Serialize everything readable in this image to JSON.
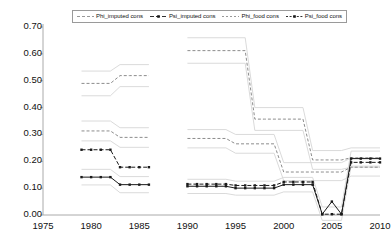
{
  "chart_data": {
    "type": "line",
    "title": "",
    "subtitle": "",
    "xlabel": "",
    "ylabel": "",
    "xlim": [
      1975,
      2010
    ],
    "ylim": [
      0.0,
      0.7
    ],
    "grid": false,
    "legend_position": "top-center",
    "xticks": [
      1975,
      1980,
      1985,
      1990,
      1995,
      2000,
      2005,
      2010
    ],
    "xtick_labels": [
      "1975",
      "1980",
      "1985",
      "1990",
      "1995",
      "2000",
      "2005",
      "2010"
    ],
    "yticks": [
      0.0,
      0.1,
      0.2,
      0.3,
      0.4,
      0.5,
      0.6,
      0.7
    ],
    "ytick_labels": [
      "0.00",
      "0.10",
      "0.20",
      "0.30",
      "0.40",
      "0.50",
      "0.60",
      "0.70"
    ],
    "series": [
      {
        "name": "Phi_imputed cons",
        "color": "#8c8c8c",
        "dash": "3,2",
        "marker": "none",
        "width": 1,
        "segments": [
          {
            "x": [
              1979,
              1980,
              1981,
              1982,
              1983,
              1984,
              1985,
              1986
            ],
            "y": [
              0.49,
              0.49,
              0.49,
              0.49,
              0.519,
              0.519,
              0.519,
              0.519
            ]
          },
          {
            "x": [
              1990,
              1991,
              1992,
              1993,
              1994,
              1995,
              1996,
              1997,
              1998,
              1999,
              2000,
              2001,
              2002,
              2003,
              2004,
              2005,
              2006,
              2007,
              2008,
              2009,
              2010
            ],
            "y": [
              0.612,
              0.612,
              0.612,
              0.612,
              0.612,
              0.612,
              0.612,
              0.357,
              0.357,
              0.357,
              0.357,
              0.357,
              0.357,
              0.205,
              0.205,
              0.205,
              0.205,
              0.213,
              0.213,
              0.213,
              0.213
            ]
          }
        ]
      },
      {
        "name": "Psi_imputed cons",
        "color": "#1a1a1a",
        "dash": "4,2",
        "marker": "square",
        "width": 1,
        "segments": [
          {
            "x": [
              1979,
              1980,
              1981,
              1982,
              1983,
              1984,
              1985,
              1986
            ],
            "y": [
              0.243,
              0.243,
              0.243,
              0.243,
              0.178,
              0.178,
              0.178,
              0.178
            ]
          },
          {
            "x": [
              1990,
              1991,
              1992,
              1993,
              1994,
              1995,
              1996,
              1997,
              1998,
              1999,
              2000,
              2001,
              2002,
              2003,
              2004,
              2005,
              2006,
              2007,
              2008,
              2009,
              2010
            ],
            "y": [
              0.115,
              0.115,
              0.115,
              0.115,
              0.115,
              0.11,
              0.11,
              0.11,
              0.11,
              0.11,
              0.123,
              0.123,
              0.123,
              0.123,
              0.003,
              0.003,
              0.003,
              0.196,
              0.196,
              0.196,
              0.196
            ]
          }
        ]
      },
      {
        "name": "Phi_food cons",
        "color": "#8c8c8c",
        "dash": "3,2",
        "marker": "none",
        "width": 1,
        "segments": [
          {
            "x": [
              1979,
              1980,
              1981,
              1982,
              1983,
              1984,
              1985,
              1986
            ],
            "y": [
              0.313,
              0.313,
              0.313,
              0.313,
              0.289,
              0.289,
              0.289,
              0.289
            ]
          },
          {
            "x": [
              1990,
              1991,
              1992,
              1993,
              1994,
              1995,
              1996,
              1997,
              1998,
              1999,
              2000,
              2001,
              2002,
              2003,
              2004,
              2005,
              2006,
              2007,
              2008,
              2009,
              2010
            ],
            "y": [
              0.285,
              0.285,
              0.285,
              0.285,
              0.285,
              0.265,
              0.265,
              0.265,
              0.265,
              0.265,
              0.16,
              0.16,
              0.16,
              0.16,
              0.16,
              0.16,
              0.16,
              0.178,
              0.178,
              0.178,
              0.178
            ]
          }
        ]
      },
      {
        "name": "Psi_food cons",
        "color": "#1a1a1a",
        "dash": "1,0",
        "marker": "square",
        "width": 1,
        "segments": [
          {
            "x": [
              1979,
              1980,
              1981,
              1982,
              1983,
              1984,
              1985,
              1986
            ],
            "y": [
              0.141,
              0.141,
              0.141,
              0.141,
              0.113,
              0.113,
              0.113,
              0.113
            ]
          },
          {
            "x": [
              1990,
              1991,
              1992,
              1993,
              1994,
              1995,
              1996,
              1997,
              1998,
              1999,
              2000,
              2001,
              2002,
              2003,
              2004,
              2005,
              2006,
              2007,
              2008,
              2009,
              2010
            ],
            "y": [
              0.107,
              0.107,
              0.107,
              0.107,
              0.107,
              0.1,
              0.1,
              0.1,
              0.1,
              0.1,
              0.113,
              0.113,
              0.113,
              0.113,
              0.003,
              0.05,
              0.003,
              0.21,
              0.21,
              0.21,
              0.21
            ]
          }
        ]
      }
    ],
    "ghost_series": [
      {
        "name": "Phi_imputed cons band",
        "color": "#d6d6d6",
        "segments": [
          {
            "x": [
              1979,
              1982,
              1983,
              1986
            ],
            "y": [
              0.536,
              0.536,
              0.56,
              0.56
            ]
          },
          {
            "x": [
              1990,
              1996,
              1997,
              2002,
              2003,
              2006,
              2007,
              2010
            ],
            "y": [
              0.66,
              0.66,
              0.4,
              0.4,
              0.24,
              0.24,
              0.25,
              0.25
            ]
          }
        ]
      },
      {
        "name": "Phi_food cons band upper",
        "color": "#d6d6d6",
        "segments": [
          {
            "x": [
              1979,
              1982,
              1983,
              1986
            ],
            "y": [
              0.35,
              0.35,
              0.325,
              0.325
            ]
          },
          {
            "x": [
              1990,
              1994,
              1995,
              1999,
              2000,
              2006,
              2007,
              2010
            ],
            "y": [
              0.318,
              0.318,
              0.3,
              0.3,
              0.195,
              0.195,
              0.212,
              0.212
            ]
          }
        ]
      },
      {
        "name": "Phi_food cons band lower",
        "color": "#d6d6d6",
        "segments": [
          {
            "x": [
              1979,
              1982,
              1983,
              1986
            ],
            "y": [
              0.276,
              0.276,
              0.252,
              0.252
            ]
          },
          {
            "x": [
              1990,
              1994,
              1995,
              1999,
              2000,
              2006,
              2007,
              2010
            ],
            "y": [
              0.25,
              0.25,
              0.23,
              0.23,
              0.128,
              0.128,
              0.145,
              0.145
            ]
          }
        ]
      },
      {
        "name": "Psi_food cons band upper",
        "color": "#d6d6d6",
        "segments": [
          {
            "x": [
              1979,
              1982,
              1983,
              1986
            ],
            "y": [
              0.17,
              0.17,
              0.143,
              0.143
            ]
          },
          {
            "x": [
              1990,
              1994,
              1995,
              1999,
              2000,
              2003,
              2004,
              2006,
              2007,
              2010
            ],
            "y": [
              0.133,
              0.133,
              0.126,
              0.126,
              0.14,
              0.14,
              0.03,
              0.03,
              0.238,
              0.238
            ]
          }
        ]
      },
      {
        "name": "Psi_food cons band lower",
        "color": "#d6d6d6",
        "segments": [
          {
            "x": [
              1979,
              1982,
              1983,
              1986
            ],
            "y": [
              0.112,
              0.112,
              0.083,
              0.083
            ]
          },
          {
            "x": [
              1990,
              1994,
              1995,
              1999,
              2000,
              2003,
              2004,
              2006,
              2007,
              2010
            ],
            "y": [
              0.08,
              0.08,
              0.074,
              0.074,
              0.086,
              0.086,
              -0.02,
              -0.02,
              0.182,
              0.182
            ]
          }
        ]
      },
      {
        "name": "Phi_imputed cons lower band",
        "color": "#d6d6d6",
        "segments": [
          {
            "x": [
              1979,
              1982,
              1983,
              1986
            ],
            "y": [
              0.444,
              0.444,
              0.478,
              0.478
            ]
          },
          {
            "x": [
              1990,
              1996,
              1997,
              2002,
              2003,
              2006,
              2007,
              2010
            ],
            "y": [
              0.565,
              0.565,
              0.315,
              0.315,
              0.17,
              0.17,
              0.178,
              0.178
            ]
          }
        ]
      }
    ]
  },
  "legend": {
    "entries": [
      {
        "label": "Phi_imputed cons",
        "swatch": "dashed-gray-line"
      },
      {
        "label": "Psi_imputed cons",
        "swatch": "dashed-black-marker-line"
      },
      {
        "label": "Phi_food cons",
        "swatch": "dotted-gray-line"
      },
      {
        "label": "Psi_food cons",
        "swatch": "dotted-black-marker-line"
      }
    ]
  },
  "axes": {
    "x_tick_labels": [
      "1975",
      "1980",
      "1985",
      "1990",
      "1995",
      "2000",
      "2005",
      "2010"
    ],
    "y_tick_labels": [
      "0.70",
      "0.60",
      "0.50",
      "0.40",
      "0.30",
      "0.20",
      "0.10",
      "0.00"
    ]
  },
  "colors": {
    "line_gray": "#8c8c8c",
    "line_black": "#1a1a1a",
    "band_gray": "#d6d6d6",
    "axis": "#aaaaaa",
    "text": "#111111"
  }
}
